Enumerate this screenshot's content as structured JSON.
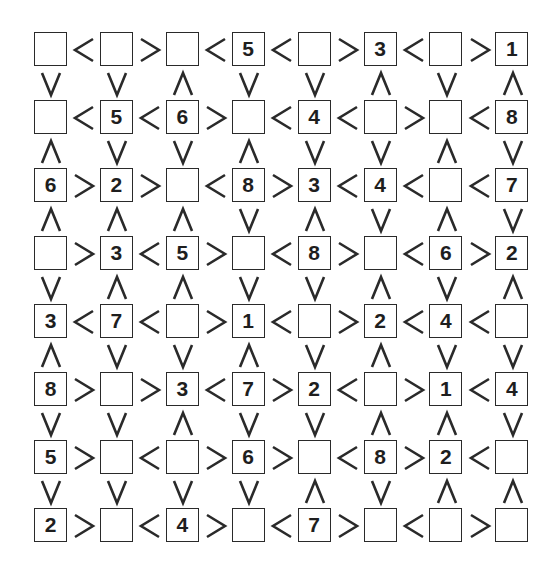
{
  "puzzle": {
    "type": "futoshiki",
    "size": 8,
    "grid": [
      [
        "",
        "",
        "",
        "5",
        "",
        "3",
        "",
        "1"
      ],
      [
        "",
        "5",
        "6",
        "",
        "4",
        "",
        "",
        "8"
      ],
      [
        "6",
        "2",
        "",
        "8",
        "3",
        "4",
        "",
        "7"
      ],
      [
        "",
        "3",
        "5",
        "",
        "8",
        "",
        "6",
        "2"
      ],
      [
        "3",
        "7",
        "",
        "1",
        "",
        "2",
        "4",
        ""
      ],
      [
        "8",
        "",
        "3",
        "7",
        "2",
        "",
        "1",
        "4"
      ],
      [
        "5",
        "",
        "",
        "6",
        "",
        "8",
        "2",
        ""
      ],
      [
        "2",
        "",
        "4",
        "",
        "7",
        "",
        "",
        ""
      ]
    ],
    "horizontal_signs": [
      [
        "<",
        ">",
        "<",
        "<",
        ">",
        "<",
        ">"
      ],
      [
        "<",
        "<",
        ">",
        "<",
        "<",
        ">",
        "<"
      ],
      [
        ">",
        ">",
        "<",
        ">",
        "<",
        "<",
        "<"
      ],
      [
        ">",
        "<",
        ">",
        "<",
        ">",
        "<",
        ">"
      ],
      [
        "<",
        "<",
        ">",
        "<",
        ">",
        "<",
        "<"
      ],
      [
        ">",
        ">",
        "<",
        ">",
        "<",
        ">",
        "<"
      ],
      [
        ">",
        "<",
        ">",
        ">",
        "<",
        ">",
        "<"
      ],
      [
        ">",
        "<",
        ">",
        "<",
        ">",
        "<",
        ">"
      ]
    ],
    "vertical_signs": [
      [
        "v",
        "v",
        "^",
        "v",
        "v",
        "^",
        "v",
        "^"
      ],
      [
        "^",
        "v",
        "v",
        "^",
        "v",
        "v",
        "^",
        "v"
      ],
      [
        "^",
        "^",
        "^",
        "v",
        "^",
        "v",
        "^",
        "v"
      ],
      [
        "v",
        "^",
        "^",
        "v",
        "v",
        "^",
        "v",
        "^"
      ],
      [
        "^",
        "v",
        "v",
        "^",
        "v",
        "^",
        "v",
        "v"
      ],
      [
        "v",
        "v",
        "^",
        "v",
        "v",
        "^",
        "^",
        "v"
      ],
      [
        "v",
        "v",
        "v",
        "v",
        "^",
        "v",
        "^",
        "^"
      ]
    ],
    "colors": {
      "line": "#2a2a2a",
      "text": "#1e1e1e",
      "background": "#ffffff"
    }
  }
}
